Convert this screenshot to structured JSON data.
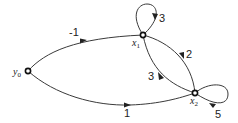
{
  "diagram": {
    "type": "signal-flow-graph",
    "nodes": [
      {
        "id": "y0",
        "label": "y",
        "subscript": "0"
      },
      {
        "id": "x1",
        "label": "x",
        "subscript": "1"
      },
      {
        "id": "x2",
        "label": "x",
        "subscript": "2"
      }
    ],
    "edges": [
      {
        "from": "y0",
        "to": "x1",
        "gain": "-1"
      },
      {
        "from": "y0",
        "to": "x2",
        "gain": "1"
      },
      {
        "from": "x1",
        "to": "x1",
        "gain": "3"
      },
      {
        "from": "x1",
        "to": "x2",
        "gain": "2"
      },
      {
        "from": "x2",
        "to": "x1",
        "gain": "3"
      },
      {
        "from": "x2",
        "to": "x2",
        "gain": "5"
      }
    ]
  }
}
